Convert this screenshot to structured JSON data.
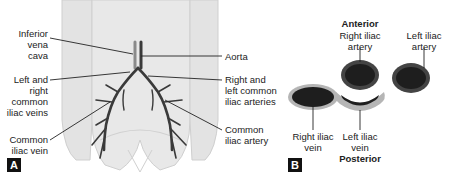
{
  "panel_a": {
    "tag": "A",
    "labels": {
      "inferior_vena_cava": "Inferior\nvena\ncava",
      "aorta": "Aorta",
      "left_right_common_iliac_veins": "Left and\nright\ncommon\niliac veins",
      "right_left_common_iliac_arteries": "Right and\nleft common\niliac arteries",
      "common_iliac_vein": "Common\niliac vein",
      "common_iliac_artery": "Common\niliac artery"
    }
  },
  "panel_b": {
    "tag": "B",
    "orientation_top": "Anterior",
    "orientation_bottom": "Posterior",
    "labels": {
      "right_iliac_artery": "Right iliac\nartery",
      "left_iliac_artery": "Left iliac\nartery",
      "right_iliac_vein": "Right iliac\nvein",
      "left_iliac_vein": "Left iliac\nvein"
    }
  },
  "colors": {
    "body_fill": "#e6e6e6",
    "body_outline": "#c8c8c8",
    "vessel": "#3a3a3a",
    "artery_fill": "#1e1e1e",
    "vein_ring": "#b5b5b5",
    "tag_bg": "#111111"
  }
}
